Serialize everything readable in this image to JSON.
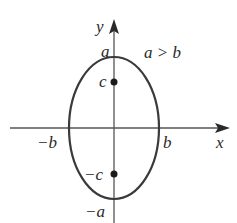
{
  "diagram": {
    "type": "ellipse-with-foci",
    "condition_label": "a > b",
    "axes": {
      "x_label": "x",
      "y_label": "y"
    },
    "vertices": {
      "top": "a",
      "bottom": "−a"
    },
    "co_vertices": {
      "left": "−b",
      "right": "b"
    },
    "foci": {
      "top": "c",
      "bottom": "−c"
    },
    "colors": {
      "stroke": "#3a3a3a",
      "background": "#ffffff"
    }
  }
}
